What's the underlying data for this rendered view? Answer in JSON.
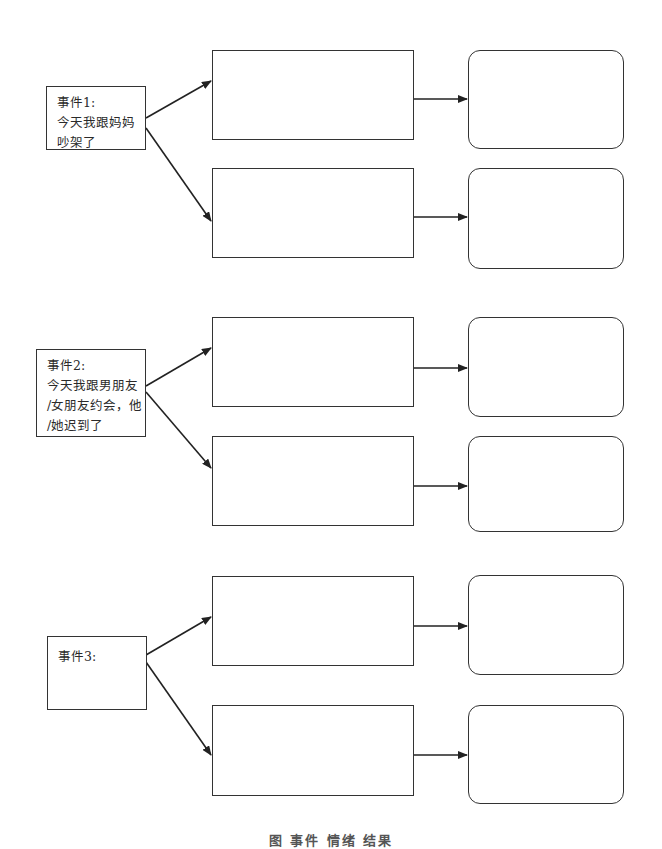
{
  "events": [
    {
      "title": "事件1:",
      "lines": [
        "今天我跟妈妈",
        "吵架了"
      ]
    },
    {
      "title": "事件2:",
      "lines": [
        "今天我跟男朋友",
        "/女朋友约会，他",
        "/她迟到了"
      ]
    },
    {
      "title": "事件3:",
      "lines": []
    }
  ],
  "caption": "图 事件 情绪 结果",
  "colors": {
    "stroke": "#333333",
    "background": "#ffffff"
  }
}
